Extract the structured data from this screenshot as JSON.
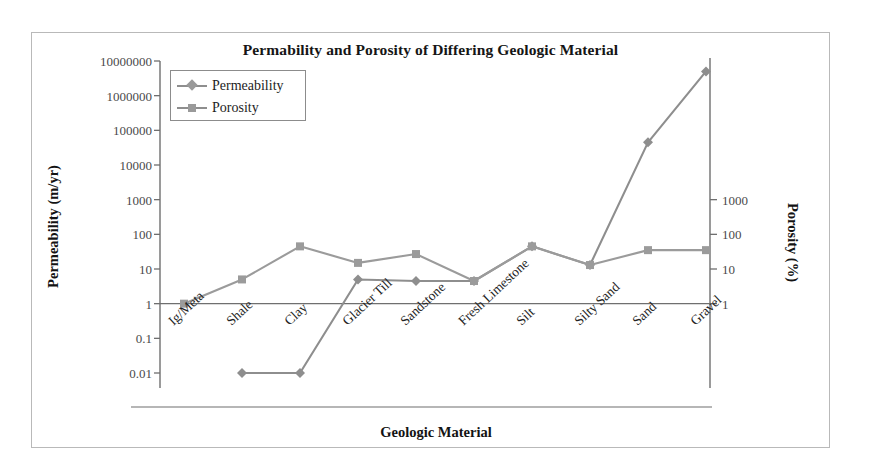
{
  "chart_data": {
    "type": "line",
    "title": "Permability and Porosity of Differing Geologic Material",
    "xlabel": "Geologic Material",
    "ylabel": "Permeability (m/yr)",
    "ylabel_secondary": "Porosity (%)",
    "grid": false,
    "legend_position": "top-left-inside",
    "categories": [
      "Ig/Meta",
      "Shale",
      "Clay",
      "Glacier Till",
      "Sandstone",
      "Fresh Limestone",
      "Silt",
      "Silty Sand",
      "Sand",
      "Gravel"
    ],
    "yscale": "log",
    "ylim": [
      0.01,
      10000000
    ],
    "yticks": [
      "10000000",
      "1000000",
      "100000",
      "10000",
      "1000",
      "100",
      "10",
      "1",
      "0.1",
      "0.01"
    ],
    "ytick_values": [
      10000000,
      1000000,
      100000,
      10000,
      1000,
      100,
      10,
      1,
      0.1,
      0.01
    ],
    "yscale_secondary": "log",
    "ylim_secondary": [
      1,
      1000
    ],
    "yticks_secondary": [
      "1000",
      "100",
      "10",
      "1"
    ],
    "ytick_secondary_values": [
      1000,
      100,
      10,
      1
    ],
    "series": [
      {
        "name": "Permeability",
        "axis": "left",
        "marker": "diamond",
        "color": "#8e8e8e",
        "values": [
          null,
          0.01,
          0.01,
          5,
          4.5,
          4.5,
          45,
          13,
          45000,
          5000000
        ]
      },
      {
        "name": "Porosity",
        "axis": "right",
        "marker": "square",
        "color": "#9b9b9b",
        "values": [
          1,
          5,
          45,
          15,
          27,
          4.5,
          45,
          13,
          35,
          35
        ]
      }
    ]
  },
  "legend": {
    "items": [
      {
        "label": "Permeability",
        "marker": "diamond"
      },
      {
        "label": "Porosity",
        "marker": "square"
      }
    ]
  },
  "colors": {
    "series_permeability": "#8e8e8e",
    "series_porosity": "#9b9b9b",
    "axis": "#6f6f6f",
    "frame": "#b9b9b9",
    "text": "#1a1a1a"
  }
}
